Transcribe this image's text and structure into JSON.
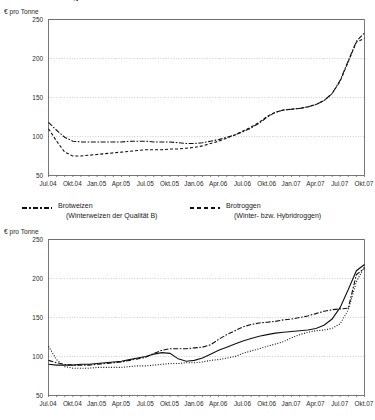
{
  "document": {
    "title": "Preisentwicklung in Deutschland"
  },
  "charts": [
    {
      "name": "chart-top",
      "unit_label": "€ pro Tonne",
      "legend": [
        {
          "label": "Brotweizen",
          "sublabel": "(Winterweizen der Qualität B)",
          "style": "dash-dot"
        },
        {
          "label": "Brotroggen",
          "sublabel": "(Winter- bzw. Hybridroggen)",
          "style": "dashed"
        }
      ]
    },
    {
      "name": "chart-bottom",
      "unit_label": "€ pro Tonne"
    }
  ],
  "chart_data": [
    {
      "type": "line",
      "title": "Preisentwicklung in Deutschland",
      "subtitle": "",
      "xlabel": "",
      "ylabel": "€ pro Tonne",
      "ylim": [
        50,
        250
      ],
      "yticks": [
        50,
        100,
        150,
        200,
        250
      ],
      "grid": true,
      "legend_position": "below",
      "tick_labels": [
        "Jul.04",
        "Okt.04",
        "Jan.05",
        "Apr.05",
        "Jul.05",
        "Okt.05",
        "Jan.06",
        "Apr.06",
        "Jul.06",
        "Okt.06",
        "Jan.07",
        "Apr.07",
        "Jul.07",
        "Okt.07"
      ],
      "x": [
        0,
        1,
        2,
        3,
        4,
        5,
        6,
        7,
        8,
        9,
        10,
        11,
        12,
        13,
        14,
        15,
        16,
        17,
        18,
        19,
        20,
        21,
        22,
        23,
        24,
        25,
        26,
        27,
        28,
        29,
        30,
        31,
        32,
        33,
        34,
        35,
        36,
        37,
        38,
        39
      ],
      "series": [
        {
          "name": "Brotweizen",
          "style": "dash-dot",
          "values": [
            118,
            108,
            99,
            94,
            93,
            93,
            93,
            93,
            93,
            93,
            94,
            94,
            94,
            93,
            93,
            93,
            92,
            91,
            91,
            92,
            94,
            96,
            99,
            102,
            106,
            111,
            117,
            125,
            131,
            134,
            135,
            136,
            138,
            141,
            146,
            155,
            172,
            197,
            222,
            233
          ]
        },
        {
          "name": "Brotroggen",
          "style": "dashed",
          "values": [
            110,
            94,
            80,
            75,
            75,
            76,
            77,
            78,
            79,
            80,
            81,
            82,
            83,
            83,
            83,
            84,
            84,
            85,
            86,
            88,
            91,
            94,
            98,
            102,
            107,
            112,
            118,
            126,
            131,
            134,
            135,
            136,
            138,
            141,
            146,
            155,
            171,
            196,
            221,
            226
          ]
        }
      ]
    },
    {
      "type": "line",
      "title": "",
      "subtitle": "",
      "xlabel": "",
      "ylabel": "€ pro Tonne",
      "ylim": [
        50,
        250
      ],
      "yticks": [
        50,
        100,
        150,
        200,
        250
      ],
      "grid": true,
      "legend_position": "none",
      "tick_labels": [
        "Jul.04",
        "Okt.04",
        "Jan.05",
        "Apr.05",
        "Jul.05",
        "Okt.05",
        "Jan.06",
        "Apr.06",
        "Jul.06",
        "Okt.06",
        "Jan.07",
        "Apr.07",
        "Jul.07",
        "Okt.07"
      ],
      "x": [
        0,
        1,
        2,
        3,
        4,
        5,
        6,
        7,
        8,
        9,
        10,
        11,
        12,
        13,
        14,
        15,
        16,
        17,
        18,
        19,
        20,
        21,
        22,
        23,
        24,
        25,
        26,
        27,
        28,
        29,
        30,
        31,
        32,
        33,
        34,
        35,
        36,
        37,
        38,
        39
      ],
      "series": [
        {
          "name": "series-1",
          "style": "dash-dot",
          "values": [
            95,
            92,
            90,
            89,
            89,
            89,
            90,
            91,
            92,
            93,
            95,
            97,
            99,
            104,
            108,
            110,
            110,
            110,
            111,
            112,
            115,
            122,
            128,
            133,
            138,
            141,
            143,
            144,
            145,
            147,
            148,
            150,
            152,
            155,
            158,
            160,
            161,
            162,
            205,
            213
          ]
        },
        {
          "name": "series-2",
          "style": "dotted",
          "values": [
            113,
            96,
            87,
            85,
            85,
            85,
            86,
            86,
            86,
            86,
            87,
            88,
            88,
            89,
            90,
            91,
            91,
            92,
            92,
            93,
            95,
            96,
            98,
            100,
            104,
            107,
            110,
            113,
            116,
            119,
            124,
            128,
            131,
            133,
            134,
            136,
            142,
            160,
            196,
            215
          ]
        },
        {
          "name": "series-3",
          "style": "solid",
          "values": [
            90,
            89,
            89,
            89,
            90,
            90,
            91,
            92,
            93,
            94,
            96,
            98,
            100,
            103,
            105,
            104,
            97,
            94,
            95,
            98,
            103,
            108,
            112,
            116,
            120,
            123,
            126,
            128,
            130,
            131,
            132,
            133,
            134,
            136,
            140,
            148,
            163,
            186,
            210,
            218
          ]
        }
      ]
    }
  ]
}
